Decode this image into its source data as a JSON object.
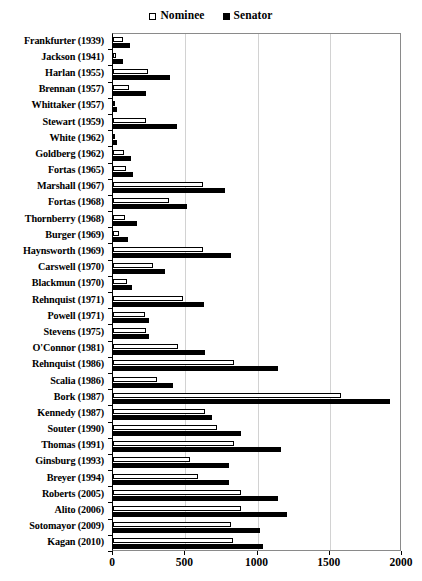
{
  "chart_data": {
    "type": "bar",
    "orientation": "horizontal",
    "title": "",
    "xlabel": "",
    "ylabel": "",
    "xlim": [
      0,
      2000
    ],
    "xticks": [
      0,
      500,
      1000,
      1500,
      2000
    ],
    "xtick_labels": [
      "0",
      "500",
      "1000",
      "1500",
      "2000"
    ],
    "grid": "vertical",
    "legend_position": "top-center",
    "legend": [
      {
        "name": "Nominee",
        "marker": "open-square",
        "color": "#ffffff",
        "edge": "#000000"
      },
      {
        "name": "Senator",
        "marker": "filled-square",
        "color": "#000000",
        "edge": "#000000"
      }
    ],
    "categories": [
      "Frankfurter (1939)",
      "Jackson (1941)",
      "Harlan (1955)",
      "Brennan (1957)",
      "Whittaker (1957)",
      "Stewart (1959)",
      "White (1962)",
      "Goldberg (1962)",
      "Fortas (1965)",
      "Marshall (1967)",
      "Fortas (1968)",
      "Thornberry (1968)",
      "Burger (1969)",
      "Haynsworth (1969)",
      "Carswell (1970)",
      "Blackmun (1970)",
      "Rehnquist (1971)",
      "Powell (1971)",
      "Stevens (1975)",
      "O'Connor (1981)",
      "Rehnquist (1986)",
      "Scalia (1986)",
      "Bork (1987)",
      "Kennedy (1987)",
      "Souter (1990)",
      "Thomas (1991)",
      "Ginsburg (1993)",
      "Breyer (1994)",
      "Roberts (2005)",
      "Alito (2006)",
      "Sotomayor (2009)",
      "Kagan (2010)"
    ],
    "series": [
      {
        "name": "Nominee",
        "values": [
          70,
          20,
          245,
          110,
          15,
          230,
          8,
          75,
          90,
          625,
          385,
          80,
          40,
          625,
          280,
          95,
          485,
          220,
          225,
          450,
          840,
          305,
          1580,
          640,
          720,
          835,
          535,
          585,
          885,
          885,
          815,
          830
        ]
      },
      {
        "name": "Senator",
        "values": [
          115,
          70,
          395,
          230,
          28,
          445,
          28,
          125,
          140,
          775,
          510,
          165,
          105,
          815,
          360,
          130,
          630,
          250,
          250,
          635,
          1140,
          415,
          1915,
          685,
          885,
          1160,
          800,
          800,
          1140,
          1205,
          1020,
          1035
        ]
      }
    ]
  }
}
